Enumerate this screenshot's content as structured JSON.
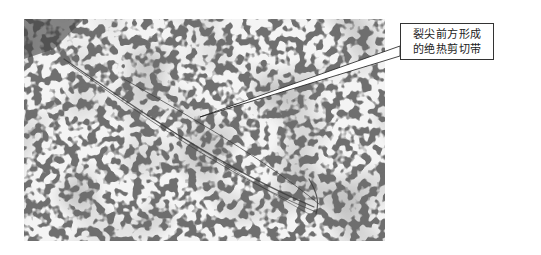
{
  "figure": {
    "annotation": {
      "line1": "裂尖前方形成",
      "line2": "的绝热剪切带"
    },
    "micrograph": {
      "description": "grayscale optical micrograph of granular microstructure with an adiabatic shear band ahead of crack tip",
      "base_color": "#7a7a7a",
      "grain_color": "#f2f2f2",
      "dark_color": "#4a4a4a"
    }
  }
}
